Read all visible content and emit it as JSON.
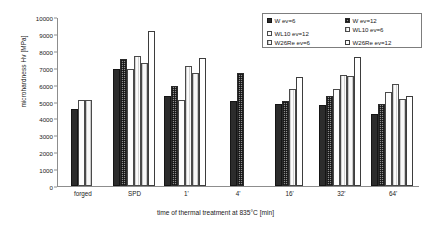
{
  "chart_data": {
    "type": "bar",
    "title": "",
    "xlabel": "time of thermal treatment at 835°C [min]",
    "ylabel": "microhardness Hv [MPa]",
    "ylim": [
      0,
      10000
    ],
    "ytick_step": 1000,
    "yticks": [
      "10000",
      "9000",
      "8000",
      "7000",
      "6000",
      "5000",
      "4000",
      "3000",
      "2000",
      "1000",
      "0"
    ],
    "grid": false,
    "legend_position": "top-right",
    "categories": [
      "forged",
      "SPD",
      "1'",
      "4'",
      "16'",
      "32'",
      "64'"
    ],
    "series": [
      {
        "name": "W ev=6",
        "swatch": "solid-black",
        "values": [
          4530,
          6950,
          5350,
          5050,
          4880,
          4780,
          4280
        ]
      },
      {
        "name": "W ev=12",
        "swatch": "checker-dark",
        "values": [
          null,
          7500,
          5900,
          6700,
          5050,
          5320,
          4850
        ]
      },
      {
        "name": "WL10 ev=12",
        "swatch": "open-white",
        "values": [
          5100,
          6900,
          5100,
          null,
          null,
          5770,
          5550
        ]
      },
      {
        "name": "WL10 ev=6",
        "swatch": "light-vertical",
        "values": [
          null,
          7700,
          7100,
          null,
          5770,
          6550,
          6050
        ]
      },
      {
        "name": "W26Re ev=6",
        "swatch": "pale-vertical",
        "values": [
          5100,
          7250,
          6700,
          null,
          null,
          6500,
          5150
        ]
      },
      {
        "name": "W26Re ev=12",
        "swatch": "open-white-2",
        "values": [
          null,
          9150,
          7580,
          null,
          6450,
          7620,
          5320
        ]
      }
    ],
    "legend": {
      "left_column": [
        "W ev=6",
        "WL10 ev=12",
        "W26Re ev=6"
      ],
      "right_column": [
        "W ev=12",
        "WL10 ev=6",
        "W26Re ev=12"
      ]
    },
    "colors": {
      "series_0": "#2c2c2c",
      "series_1": "#8f8f8f",
      "series_2": "#fdfdfd",
      "series_3": "#f2f2f2",
      "series_4": "#ededed",
      "series_5": "#ffffff",
      "axis": "#8d8d8d",
      "text": "#1b1b1b",
      "background": "#ffffff"
    }
  }
}
